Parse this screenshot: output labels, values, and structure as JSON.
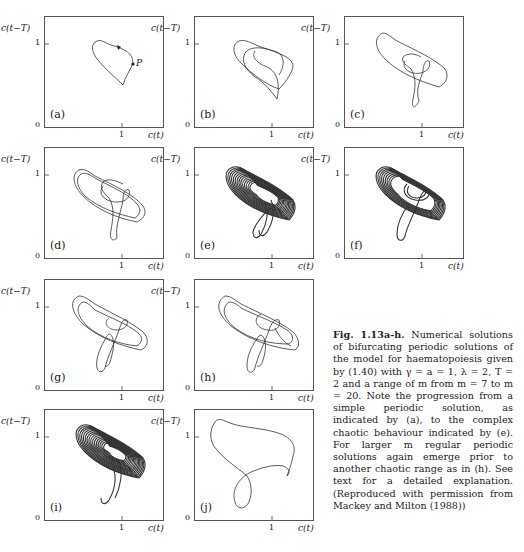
{
  "figure": {
    "axis_labels": {
      "y": "c(t−T)",
      "x": "c(t)",
      "y_tick": "1",
      "x_tick": "1",
      "origin": "0"
    },
    "panels": [
      {
        "id": "a",
        "label": "(a)",
        "annotation": "P"
      },
      {
        "id": "b",
        "label": "(b)"
      },
      {
        "id": "c",
        "label": "(c)"
      },
      {
        "id": "d",
        "label": "(d)"
      },
      {
        "id": "e",
        "label": "(e)"
      },
      {
        "id": "f",
        "label": "(f)"
      },
      {
        "id": "g",
        "label": "(g)"
      },
      {
        "id": "h",
        "label": "(h)"
      },
      {
        "id": "i",
        "label": "(i)"
      },
      {
        "id": "j",
        "label": "(j)"
      }
    ]
  },
  "caption": {
    "title": "Fig. 1.13a-h.",
    "body": "Numerical solutions of bifurcating periodic solutions of the model for haematopoiesis given by (1.40) with γ = a = 1, λ = 2, T = 2 and a range of m from m = 7 to m = 20. Note the progression from a simple periodic solution, as indicated by (a), to the complex chaotic behaviour indicated by (e). For larger m regular periodic solutions again emerge prior to another chaotic range as in (h). See text for a detailed explanation. (Reproduced with permission from Mackey and Milton (1988))"
  }
}
